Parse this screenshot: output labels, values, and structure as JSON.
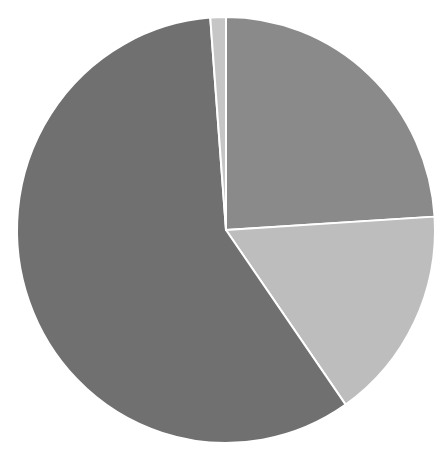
{
  "chart_data": {
    "type": "pie",
    "title": "",
    "labels": [
      "Slice A",
      "Slice B",
      "Slice C",
      "Slice D"
    ],
    "values": [
      24.0,
      16.3,
      58.5,
      1.2
    ],
    "colors": [
      "#8a8a8a",
      "#bdbdbd",
      "#707070",
      "#c6c6c6"
    ],
    "start_angle_deg": 0,
    "direction": "clockwise",
    "legend": false,
    "center": [
      226,
      230
    ],
    "radius": [
      209,
      213
    ],
    "stroke": "#ffffff"
  }
}
